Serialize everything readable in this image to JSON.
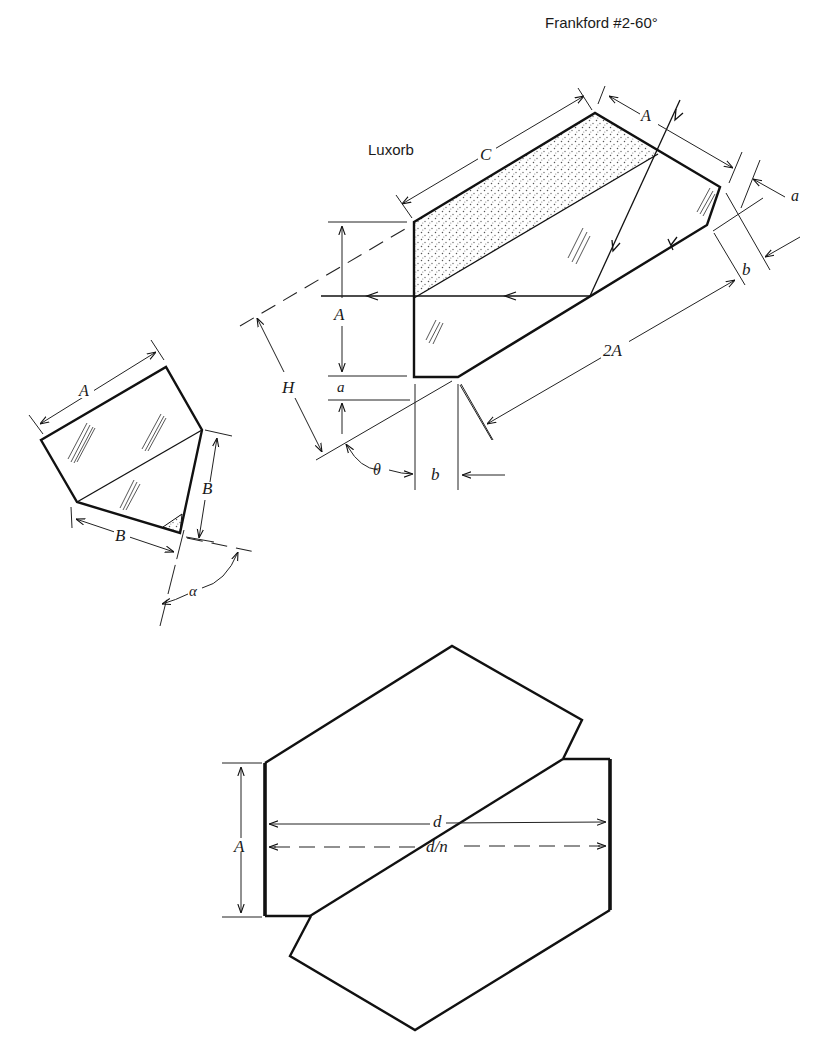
{
  "title": "Frankford #2-60°",
  "figures": {
    "luxorb": {
      "label": "Luxorb",
      "dimensions": {
        "C": "C",
        "A_top": "A",
        "a_right": "a",
        "b_right": "b",
        "two_A": "2A",
        "A_left": "A",
        "a_left": "a",
        "H": "H",
        "theta": "θ",
        "b_bottom": "b"
      },
      "features": [
        "stippled absorbing coating band",
        "incident ray reflected to horizontal output",
        "glass hatch marks"
      ]
    },
    "left_prism": {
      "dimensions": {
        "A": "A",
        "B_right": "B",
        "B_bottom": "B",
        "alpha": "α"
      },
      "features": [
        "small stippled triangle at lower corner",
        "glass hatch marks"
      ]
    },
    "offset_pair": {
      "dimensions": {
        "A": "A",
        "d": "d",
        "d_over_n": "d/n"
      },
      "features": [
        "two hexagonal prisms cemented along diagonal",
        "thick end faces"
      ]
    }
  },
  "colors": {
    "ink": "#111111",
    "background": "#ffffff",
    "stipple": "#555555"
  }
}
